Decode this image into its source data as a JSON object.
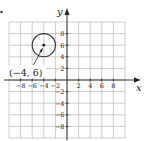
{
  "chart_data": {
    "type": "scatter",
    "title": "",
    "xlabel": "x",
    "ylabel": "y",
    "xlim": [
      -10,
      10
    ],
    "ylim": [
      -10,
      10
    ],
    "grid": true,
    "grid_step": 2,
    "x_ticks": [
      -8,
      -6,
      -4,
      -2,
      2,
      4,
      6,
      8
    ],
    "y_ticks": [
      8,
      6,
      4,
      2,
      -2,
      -4,
      -6,
      -8
    ],
    "x_tick_labels": [
      "−8",
      "−6",
      "−4",
      "−2",
      "2",
      "4",
      "6",
      "8"
    ],
    "y_tick_labels": [
      "8",
      "6",
      "4",
      "2",
      "−2",
      "−4",
      "−6",
      "−8"
    ],
    "shapes": [
      {
        "type": "circle",
        "center": [
          -4,
          6
        ],
        "radius": 2
      }
    ],
    "points": [
      {
        "x": -4,
        "y": 6,
        "label": "(−4, 6)"
      }
    ],
    "annotations": [
      {
        "text": "(−4, 6)",
        "points_to": [
          -4,
          6
        ]
      }
    ]
  },
  "labels": {
    "x_axis": "x",
    "y_axis": "y",
    "center_point": "(−4, 6)"
  },
  "colors": {
    "grid": "#b8b8b8",
    "axis": "#222222",
    "circle": "#333333"
  }
}
